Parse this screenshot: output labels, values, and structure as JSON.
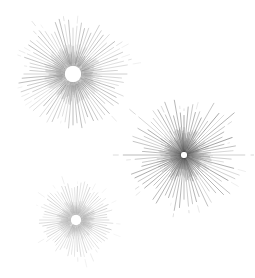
{
  "figure": {
    "background_color": "#ffffff",
    "width": 255,
    "height": 278,
    "element_count": 3
  },
  "chart_data": {
    "type": "scatter",
    "subtitle": "",
    "xlabel": "",
    "ylabel": "",
    "grid": false,
    "legend_position": "none",
    "xlim": [
      0,
      255
    ],
    "ylim": [
      0,
      278
    ],
    "axis_ticks_visible": false,
    "tick_labels": [],
    "annotations": [],
    "series": [
      {
        "name": "starburst-large-top-left",
        "cx": 73,
        "cy": 74,
        "inner_radius": 8,
        "outer_radius": 56,
        "ray_count": 76,
        "stroke_color": "#8a8a8a",
        "core_color": "#6e6e6e",
        "hub_color": "#ffffff",
        "stroke_width": 0.55,
        "length_jitter": 0.22,
        "long_ray_every": 6,
        "long_ray_scale": 1.05,
        "seed": 11
      },
      {
        "name": "starburst-dark-right",
        "cx": 184,
        "cy": 155,
        "inner_radius": 3,
        "outer_radius": 57,
        "ray_count": 72,
        "stroke_color": "#7a7a7a",
        "core_color": "#3a3a3a",
        "hub_color": "#ffffff",
        "stroke_width": 0.6,
        "length_jitter": 0.3,
        "long_ray_every": 4,
        "long_ray_scale": 1.18,
        "seed": 29
      },
      {
        "name": "starburst-small-bottom-left",
        "cx": 76,
        "cy": 220,
        "inner_radius": 5,
        "outer_radius": 38,
        "ray_count": 70,
        "stroke_color": "#a8a8a8",
        "core_color": "#9a9a9a",
        "hub_color": "#ffffff",
        "stroke_width": 0.5,
        "length_jitter": 0.2,
        "long_ray_every": 5,
        "long_ray_scale": 1.04,
        "seed": 47
      }
    ]
  }
}
